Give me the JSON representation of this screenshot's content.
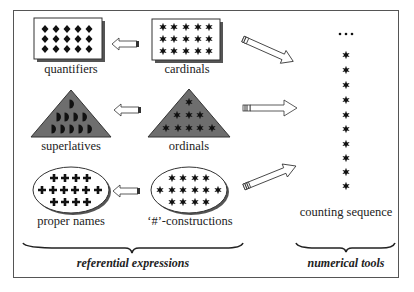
{
  "diagram": {
    "groups": {
      "referential": {
        "label": "referential expressions"
      },
      "numerical": {
        "label": "numerical tools"
      }
    },
    "nodes": [
      {
        "id": "quantifiers",
        "label": "quantifiers",
        "shape": "rectangle",
        "symbol": "diamond",
        "rows": [
          5,
          5,
          5
        ]
      },
      {
        "id": "cardinals",
        "label": "cardinals",
        "shape": "rectangle",
        "symbol": "star",
        "rows": [
          5,
          5,
          5
        ]
      },
      {
        "id": "superlatives",
        "label": "superlatives",
        "shape": "triangle",
        "symbol": "half-circle",
        "rows": [
          1,
          4,
          5
        ]
      },
      {
        "id": "ordinals",
        "label": "ordinals",
        "shape": "triangle",
        "symbol": "star",
        "rows": [
          1,
          3,
          5
        ]
      },
      {
        "id": "proper_names",
        "label": "proper names",
        "shape": "ellipse",
        "symbol": "cross",
        "rows": [
          4,
          6,
          4
        ]
      },
      {
        "id": "hash_constructions",
        "label": "‘#’-constructions",
        "shape": "ellipse",
        "symbol": "star",
        "rows": [
          4,
          6,
          4
        ]
      },
      {
        "id": "counting_sequence",
        "label": "counting sequence",
        "shape": "column",
        "symbol": "star",
        "count": 10,
        "ellipsis": "..."
      }
    ],
    "edges": [
      {
        "from": "cardinals",
        "to": "quantifiers"
      },
      {
        "from": "ordinals",
        "to": "superlatives"
      },
      {
        "from": "hash_constructions",
        "to": "proper_names"
      },
      {
        "from": "cardinals",
        "to": "counting_sequence"
      },
      {
        "from": "ordinals",
        "to": "counting_sequence"
      },
      {
        "from": "hash_constructions",
        "to": "counting_sequence"
      }
    ],
    "colors": {
      "triangle_fill": "#6e6e6e",
      "shape_fill": "#ffffff",
      "ink": "#111111",
      "shadow": "#555555"
    }
  }
}
